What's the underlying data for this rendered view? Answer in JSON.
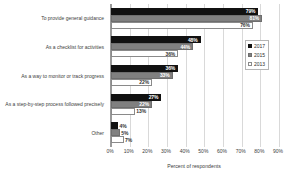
{
  "chart_data": {
    "type": "bar",
    "orientation": "horizontal",
    "title": "",
    "xlabel": "Percent of respondents",
    "ylabel": "",
    "xlim": [
      0,
      90
    ],
    "xticks": [
      "0%",
      "10%",
      "20%",
      "30%",
      "40%",
      "50%",
      "60%",
      "70%",
      "80%",
      "90%"
    ],
    "grid": true,
    "legend_position": "right",
    "categories": [
      "To provide general guidance",
      "As a checklist for activities",
      "As a way to monitor or track progress",
      "As a step-by-step process followed precisely",
      "Other"
    ],
    "series": [
      {
        "name": "2017",
        "color": "#111111",
        "values": [
          79,
          48,
          36,
          27,
          4
        ],
        "labels": [
          "79%",
          "48%",
          "36%",
          "27%",
          "4%"
        ]
      },
      {
        "name": "2015",
        "color": "#808080",
        "values": [
          81,
          44,
          33,
          22,
          5
        ],
        "labels": [
          "81%",
          "44%",
          "33%",
          "22%",
          "5%"
        ]
      },
      {
        "name": "2013",
        "color": "#ffffff",
        "values": [
          76,
          36,
          22,
          13,
          7
        ],
        "labels": [
          "76%",
          "36%",
          "22%",
          "13%",
          "7%"
        ]
      }
    ]
  },
  "legend": {
    "items": [
      {
        "label": "2017"
      },
      {
        "label": "2015"
      },
      {
        "label": "2013"
      }
    ]
  },
  "axis": {
    "x_title": "Percent of respondents"
  }
}
